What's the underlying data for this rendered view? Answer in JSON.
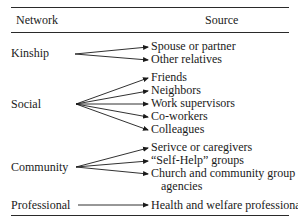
{
  "header": {
    "network_col": "Network",
    "source_col": "Source"
  },
  "rows": [
    {
      "network": "Kinship",
      "sources": [
        "Spouse or partner",
        "Other relatives"
      ]
    },
    {
      "network": "Social",
      "sources": [
        "Friends",
        "Neighbors",
        "Work supervisors",
        "Co-workers",
        "Colleagues"
      ]
    },
    {
      "network": "Community",
      "sources": [
        "Serivce or caregivers",
        "“Self-Help” groups",
        "Church and community group",
        "agencies"
      ]
    },
    {
      "network": "Professional",
      "sources": [
        "Health and welfare professionals"
      ]
    }
  ],
  "colors": {
    "text": "#1a1a1a",
    "rule": "#2a2a2a",
    "background": "#ffffff"
  }
}
